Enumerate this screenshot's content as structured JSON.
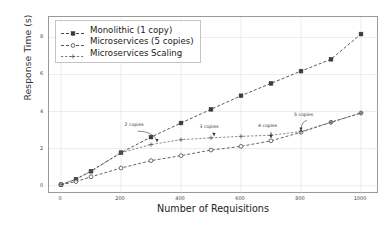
{
  "chart_data": {
    "type": "line",
    "title": "",
    "xlabel": "Number of Requisitions",
    "ylabel": "Response Time (s)",
    "xlim": [
      -40,
      1060
    ],
    "ylim": [
      -0.45,
      9.1
    ],
    "xticks": [
      0,
      200,
      400,
      600,
      800,
      1000
    ],
    "yticks": [
      0,
      2,
      4,
      6,
      8
    ],
    "xtick_labels": [
      "0",
      "200",
      "400",
      "600",
      "800",
      "1000"
    ],
    "ytick_labels": [
      "0",
      "2",
      "4",
      "6",
      "8"
    ],
    "grid": true,
    "legend_position": "upper left",
    "series": [
      {
        "name": "Monolithic (1 copy)",
        "marker": "square",
        "linestyle": "dashed",
        "color": "#3a3a3a",
        "x": [
          0,
          50,
          100,
          200,
          300,
          400,
          500,
          600,
          700,
          800,
          900,
          1000
        ],
        "y": [
          0.05,
          0.35,
          0.78,
          1.78,
          2.62,
          3.38,
          4.12,
          4.85,
          5.52,
          6.18,
          6.82,
          8.18
        ]
      },
      {
        "name": "Microservices (5 copies)",
        "marker": "circle-open",
        "linestyle": "dashed",
        "color": "#4a4a4a",
        "x": [
          0,
          50,
          100,
          200,
          300,
          400,
          500,
          600,
          700,
          800,
          900,
          1000
        ],
        "y": [
          0.05,
          0.22,
          0.48,
          0.95,
          1.35,
          1.62,
          1.92,
          2.12,
          2.42,
          2.88,
          3.42,
          3.92
        ]
      },
      {
        "name": "Microservices Scaling",
        "marker": "plus",
        "linestyle": "dashed",
        "color": "#555555",
        "x": [
          0,
          50,
          100,
          200,
          300,
          400,
          500,
          600,
          700,
          800,
          900,
          1000
        ],
        "y": [
          0.05,
          0.35,
          0.78,
          1.78,
          2.22,
          2.48,
          2.58,
          2.66,
          2.72,
          2.92,
          3.42,
          3.92
        ]
      }
    ],
    "annotations": [
      {
        "text": "2 copies",
        "label_x": 255,
        "label_y": 3.05,
        "point_x": 320,
        "point_y": 2.3
      },
      {
        "text": "3 copies",
        "label_x": 505,
        "label_y": 2.95,
        "point_x": 510,
        "point_y": 2.62
      },
      {
        "text": "4 copies",
        "label_x": 700,
        "label_y": 3.02,
        "point_x": 700,
        "point_y": 2.52
      },
      {
        "text": "5 copies",
        "label_x": 820,
        "label_y": 3.62,
        "point_x": 800,
        "point_y": 2.92
      }
    ]
  },
  "legend": {
    "items": [
      {
        "label": "Monolithic (1 copy)",
        "marker": "square"
      },
      {
        "label": "Microservices (5 copies)",
        "marker": "circle-open"
      },
      {
        "label": "Microservices Scaling",
        "marker": "plus"
      }
    ]
  }
}
